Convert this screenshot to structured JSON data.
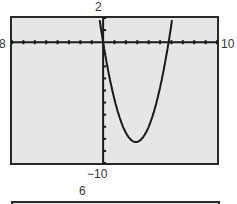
{
  "chart_data": {
    "type": "line",
    "title": "",
    "xlabel": "",
    "ylabel": "",
    "window": {
      "xmin": -8,
      "xmax": 10,
      "ymin": -10,
      "ymax": 2,
      "xscl": 1,
      "yscl": 1
    },
    "xlim": [
      -8,
      10
    ],
    "ylim": [
      -10,
      2
    ],
    "grid": false,
    "series": [
      {
        "name": "y = x^2 - 5.75x",
        "x": [
          -0.3,
          0,
          0.5,
          1,
          1.5,
          2,
          2.5,
          2.875,
          3,
          3.5,
          4,
          4.5,
          5,
          5.5,
          5.75,
          6,
          6.2
        ],
        "y": [
          1.8,
          0,
          -2.63,
          -4.75,
          -6.38,
          -7.5,
          -8.13,
          -8.27,
          -8.25,
          -7.88,
          -7.0,
          -5.63,
          -3.75,
          -1.38,
          0,
          1.5,
          2.0
        ]
      }
    ],
    "labels": {
      "ymax": "2",
      "xmin": "-8",
      "xmax": "10",
      "ymin": "−10",
      "next_ymax": "6"
    }
  }
}
